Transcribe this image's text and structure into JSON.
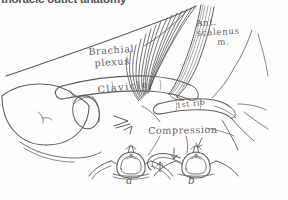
{
  "figure": {
    "caption_banner": "thoracic outlet anatomy",
    "background_color": "#ffffff",
    "ink_color": "#3a3a38",
    "width": 288,
    "height": 200
  },
  "labels": {
    "brachial_plexus_line1": "Brachial",
    "brachial_plexus_line2": "plexus",
    "ant_scalenus_line1": "Ant.",
    "ant_scalenus_line2": "scalenus",
    "ant_scalenus_line3": "m.",
    "clavicle": "Clavicle",
    "first_rib": "1st rib",
    "compression": "Compression",
    "panel_a": "a",
    "panel_b": "b"
  },
  "structures": {
    "shoulder": "shoulder-and-humeral-head-outline",
    "clavicle_bone": "clavicle-bone",
    "first_rib_bone": "first-rib",
    "nerve_trunks": "brachial-plexus-nerve-trunks",
    "scalene_muscle": "anterior-scalenus-muscle",
    "compression_arrows": "compression-arrowheads"
  },
  "insets": {
    "a": {
      "label": "a",
      "description": "normal-vertebra-with-first-rib"
    },
    "b": {
      "label": "b",
      "description": "vertebra-with-cervical-rib-compression"
    }
  }
}
